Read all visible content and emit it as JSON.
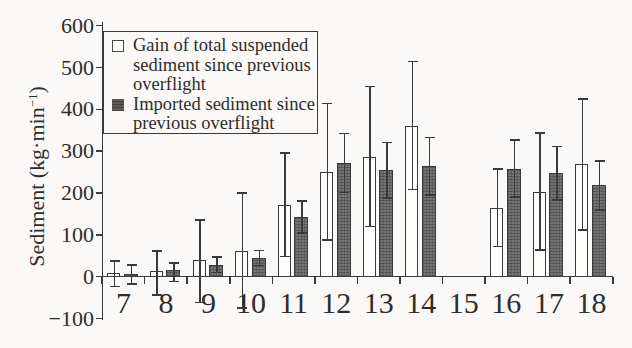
{
  "figure": {
    "background": "#faf9f7",
    "stroke_color": "#3a3a3a",
    "text_color": "#2e2d2b",
    "bar_open_fill": "#fdfdfc",
    "bar_filled_fill": "#757474"
  },
  "legend": {
    "position": "upper-left",
    "items": [
      {
        "marker": "open-square",
        "lines": [
          "Gain of total suspended",
          "sediment since previous",
          "overflight"
        ]
      },
      {
        "marker": "filled-square",
        "lines": [
          "Imported sediment since",
          "previous overflight"
        ]
      }
    ]
  },
  "y_axis": {
    "label_main": "Sediment (kg·min",
    "label_sup": "−1",
    "label_close": ")",
    "tick_labels": [
      "600",
      "500",
      "400",
      "300",
      "200",
      "100",
      "0",
      "−100"
    ]
  },
  "x_axis": {
    "tick_labels": [
      "7",
      "8",
      "9",
      "10",
      "11",
      "12",
      "13",
      "14",
      "15",
      "16",
      "17",
      "18"
    ]
  },
  "chart_data": {
    "type": "bar",
    "title": "",
    "xlabel": "",
    "ylabel": "Sediment (kg·min−1)",
    "ylim": [
      -100,
      600
    ],
    "ytick_step": 100,
    "grid": false,
    "legend_position": "upper-left",
    "categories": [
      7,
      8,
      9,
      10,
      11,
      12,
      13,
      14,
      15,
      16,
      17,
      18
    ],
    "series": [
      {
        "name": "Gain of total suspended sediment since previous overflight",
        "style": "open",
        "values": [
          8,
          13,
          40,
          62,
          172,
          250,
          287,
          360,
          null,
          165,
          202,
          269
        ],
        "err_low": [
          -23,
          -44,
          -62,
          -75,
          48,
          88,
          120,
          209,
          null,
          72,
          64,
          112
        ],
        "err_high": [
          38,
          61,
          135,
          200,
          296,
          414,
          455,
          514,
          null,
          257,
          343,
          425
        ]
      },
      {
        "name": "Imported sediment since previous overflight",
        "style": "filled",
        "values": [
          6,
          16,
          29,
          45,
          142,
          271,
          254,
          265,
          null,
          258,
          247,
          219
        ],
        "err_low": [
          -18,
          -12,
          10,
          27,
          104,
          201,
          188,
          195,
          null,
          191,
          183,
          160
        ],
        "err_high": [
          28,
          33,
          47,
          63,
          181,
          342,
          321,
          333,
          null,
          327,
          311,
          277
        ]
      }
    ]
  }
}
